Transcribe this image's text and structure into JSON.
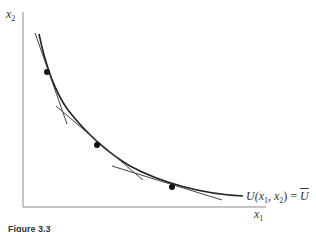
{
  "figure": {
    "y_axis_label": {
      "var": "x",
      "sub": "2"
    },
    "x_axis_label": {
      "var": "x",
      "sub": "1"
    },
    "curve_label": {
      "prefix": "U(x",
      "sub1": "1",
      "mid": ", x",
      "sub2": "2",
      "suffix": ") = ",
      "value": "U"
    },
    "caption": "Figure 3.3",
    "colors": {
      "axis": "#8a8a8a",
      "curve": "#222222",
      "tangent": "#444444",
      "dot": "#111111"
    },
    "points": [
      {
        "x": 47,
        "y": 72
      },
      {
        "x": 97,
        "y": 145
      },
      {
        "x": 172,
        "y": 187
      }
    ]
  }
}
